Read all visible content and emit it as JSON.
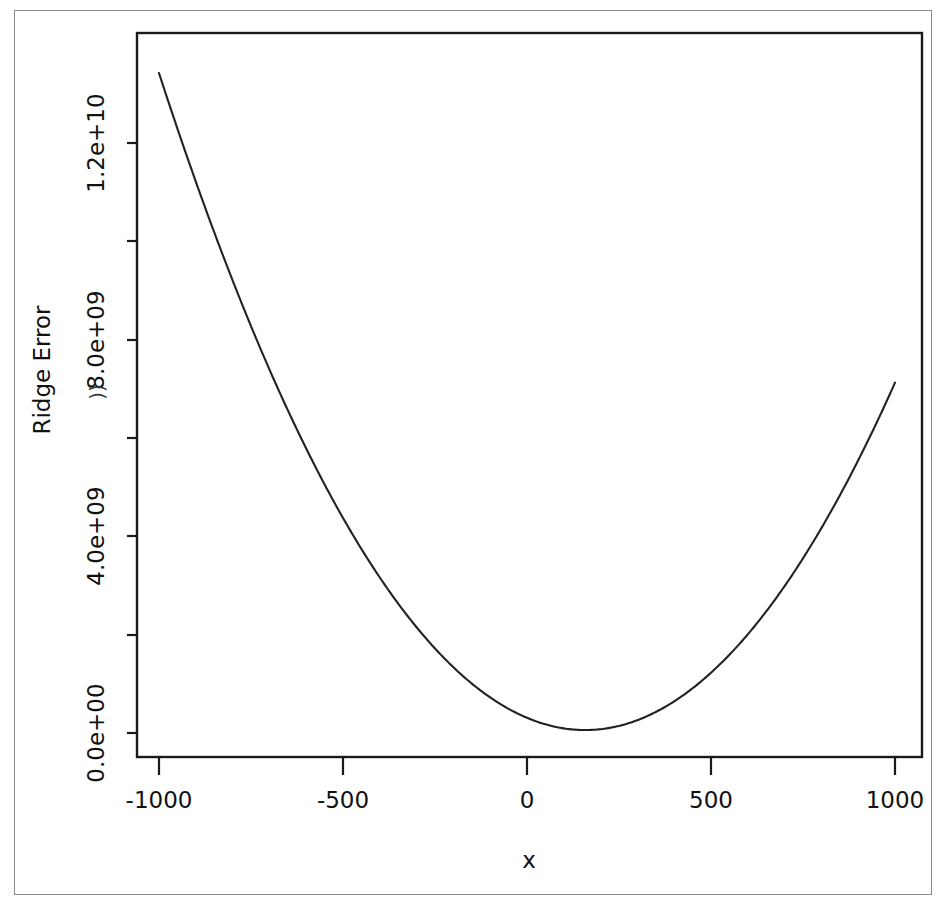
{
  "figure": {
    "background_color": "#ffffff",
    "ink_color": "#1a1a1a",
    "curve_color": "#222222",
    "frame_color": "#8a8a8a",
    "artifact_mark": "))"
  },
  "chart_data": {
    "type": "line",
    "title": "",
    "xlabel": "x",
    "ylabel": "Ridge Error",
    "xlim": [
      -1080,
      1080
    ],
    "ylim": [
      -400000000,
      14400000000
    ],
    "grid": false,
    "legend": null,
    "x_ticks": [
      -1000,
      -500,
      0,
      500,
      1000
    ],
    "x_tick_labels": [
      "-1000",
      "-500",
      "0",
      "500",
      "1000"
    ],
    "y_ticks": [
      0,
      2000000000,
      4000000000,
      6000000000,
      8000000000,
      10000000000,
      12000000000
    ],
    "y_tick_labels": [
      "0.0e+00",
      "",
      "4.0e+09",
      "",
      "8.0e+09",
      "",
      "1.2e+10"
    ],
    "y_major_tick_labels": [
      "0.0e+00",
      "4.0e+09",
      "8.0e+09",
      "1.2e+10"
    ],
    "series": [
      {
        "name": "Ridge Error",
        "x": [
          -1000,
          -900,
          -800,
          -700,
          -600,
          -500,
          -400,
          -300,
          -200,
          -100,
          0,
          100,
          158,
          200,
          300,
          400,
          500,
          600,
          700,
          800,
          900,
          1000
        ],
        "y": [
          13400000000,
          12020000000,
          10720000000,
          9500000000,
          8360000000,
          7300000000,
          6320000000,
          5420000000,
          4600000000,
          3860000000,
          3200000000,
          2620000000,
          2360000000,
          2420000000,
          2420000000,
          2700000000,
          3060000000,
          3500000000,
          4020000000,
          4620000000,
          5300000000,
          6060000000
        ]
      }
    ],
    "curve_model": {
      "form": "quadratic",
      "vertex_x": 158,
      "vertex_y": 60000000,
      "value_at_x_minus_1000": 13400000000,
      "value_at_x_1000": 6060000000
    }
  },
  "axes": {
    "x_axis_label": "x",
    "y_axis_label": "Ridge Error"
  }
}
